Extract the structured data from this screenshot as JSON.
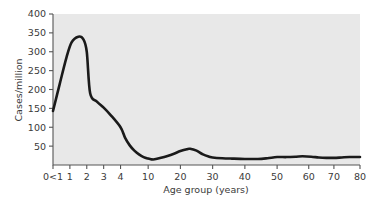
{
  "chart_data": {
    "type": "line",
    "title": "",
    "xlabel": "Age group (years)",
    "ylabel": "Cases/million",
    "ylim": [
      0,
      400
    ],
    "ytick_values": [
      50,
      100,
      150,
      200,
      250,
      300,
      350,
      400
    ],
    "ytick_labels": [
      "50",
      "100",
      "150",
      "200",
      "250",
      "300",
      "350",
      "400"
    ],
    "xtick_labels": [
      "0<1",
      "1",
      "2",
      "3",
      "4",
      "10",
      "20",
      "30",
      "40",
      "50",
      "60",
      "70",
      "80"
    ],
    "xtick_values": [
      0,
      1,
      2,
      3,
      4,
      10,
      20,
      30,
      40,
      50,
      60,
      70,
      80
    ],
    "x_axis_scale": "piecewise-compressed",
    "grid": false,
    "legend": null,
    "series": [
      {
        "name": "Cases/million",
        "color": "#1a1a1a",
        "x": [
          0,
          0.4,
          0.8,
          1.1,
          1.5,
          1.8,
          2.0,
          2.2,
          2.6,
          3.0,
          3.4,
          4.0,
          5.0,
          6.0,
          7.0,
          8.0,
          9.0,
          10.0,
          11.0,
          12.0,
          14.0,
          16.0,
          18.0,
          20.0,
          22.0,
          23.0,
          25.0,
          27.0,
          29.0,
          30.0,
          33.0,
          36.0,
          40.0,
          44.0,
          47.0,
          50.0,
          53.0,
          56.0,
          58.0,
          61.0,
          64.0,
          67.0,
          70.0,
          73.0,
          76.0,
          80.0
        ],
        "values": [
          143,
          215,
          285,
          325,
          340,
          333,
          300,
          190,
          168,
          152,
          133,
          100,
          72,
          52,
          38,
          28,
          21,
          17,
          15,
          15,
          19,
          24,
          30,
          37,
          42,
          43,
          38,
          28,
          22,
          20,
          18,
          17,
          16,
          16,
          18,
          21,
          21,
          22,
          23,
          22,
          20,
          19,
          19,
          20,
          21,
          21
        ]
      }
    ],
    "annotations": {
      "primary_peak": {
        "x_label": "1.5",
        "value": 340
      },
      "minimum": {
        "x_label": "11-12",
        "value": 15
      },
      "secondary_peak": {
        "x_label": "22-23",
        "value": 43
      },
      "start_value": {
        "x_label": "0<1",
        "value": 143
      }
    },
    "style": {
      "plot_background": "#e8e8e8",
      "figure_background": "#ffffff",
      "line_color": "#1a1a1a",
      "axis_color": "#555555",
      "text_color": "#3a3a3a",
      "line_width": 2.6
    }
  }
}
